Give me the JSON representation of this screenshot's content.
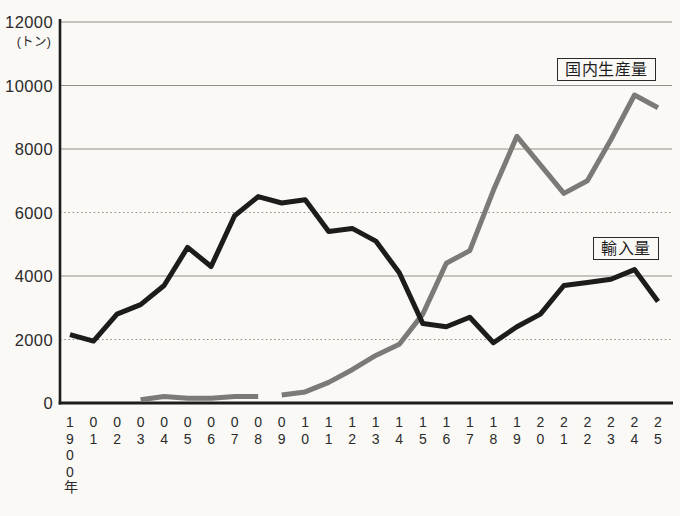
{
  "figure": {
    "unit_label": "(トン)",
    "background": "#faf9f6"
  },
  "chart_data": {
    "type": "line",
    "title": "",
    "xlabel": "",
    "ylabel": "トン",
    "x_years": [
      1900,
      1901,
      1902,
      1903,
      1904,
      1905,
      1906,
      1907,
      1908,
      1909,
      1910,
      1911,
      1912,
      1913,
      1914,
      1915,
      1916,
      1917,
      1918,
      1919,
      1920,
      1921,
      1922,
      1923,
      1924,
      1925
    ],
    "x_tick_labels": [
      "1900年",
      "01",
      "02",
      "03",
      "04",
      "05",
      "06",
      "07",
      "08",
      "09",
      "10",
      "11",
      "12",
      "13",
      "14",
      "15",
      "16",
      "17",
      "18",
      "19",
      "20",
      "21",
      "22",
      "23",
      "24",
      "25"
    ],
    "ylim": [
      0,
      12000
    ],
    "yticks": [
      0,
      2000,
      4000,
      6000,
      8000,
      10000,
      12000
    ],
    "dotted_gridlines": [
      2000,
      6000
    ],
    "grid": "horizontal",
    "legend_position": "boxed-labels-on-plot",
    "series": [
      {
        "name": "国内生産量",
        "color": "#7b7a76",
        "line_width": 5,
        "segments": [
          [
            3,
            8
          ],
          [
            9,
            25
          ]
        ],
        "values": [
          null,
          null,
          null,
          100,
          200,
          150,
          150,
          200,
          200,
          250,
          350,
          650,
          1050,
          1500,
          1850,
          2800,
          4400,
          4800,
          6700,
          8400,
          7500,
          6600,
          7000,
          8300,
          9700,
          9300
        ]
      },
      {
        "name": "輸入量",
        "color": "#1c1c1a",
        "line_width": 5,
        "segments": [
          [
            0,
            25
          ]
        ],
        "values": [
          2150,
          1950,
          2800,
          3100,
          3700,
          4900,
          4300,
          5900,
          6500,
          6300,
          6400,
          5400,
          5500,
          5100,
          4100,
          2500,
          2400,
          2700,
          1900,
          2400,
          2800,
          3700,
          3800,
          3900,
          4200,
          3200
        ]
      }
    ]
  }
}
